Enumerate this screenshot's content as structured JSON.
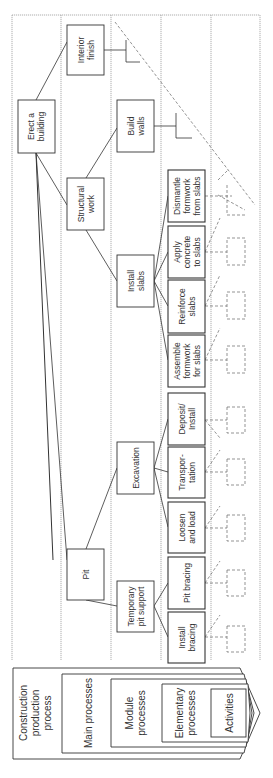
{
  "diagram": {
    "orientation": "rotated-90-ccw",
    "levels": [
      {
        "id": "L1",
        "label": "Construction production process"
      },
      {
        "id": "L2",
        "label": "Main processes"
      },
      {
        "id": "L3",
        "label": "Module processes"
      },
      {
        "id": "L4",
        "label": "Elementary processes"
      },
      {
        "id": "L5",
        "label": "Activities"
      }
    ],
    "nodes": {
      "root": {
        "line1": "Erect a",
        "line2": "building"
      },
      "interior": {
        "line1": "Interior",
        "line2": "finish"
      },
      "structural": {
        "line1": "Structural",
        "line2": "work"
      },
      "pit": {
        "line1": "Pit",
        "line2": ""
      },
      "walls": {
        "line1": "Build",
        "line2": "walls"
      },
      "slabs": {
        "line1": "Install",
        "line2": "slabs"
      },
      "excavation": {
        "line1": "Excavation",
        "line2": ""
      },
      "temp": {
        "line1": "Temporary",
        "line2": "pit support"
      },
      "dismantle": {
        "line1": "Dismantle",
        "line2": "formwork",
        "line3": "from slabs"
      },
      "apply": {
        "line1": "Apply",
        "line2": "concrete",
        "line3": "to slabs"
      },
      "reinforce": {
        "line1": "Reinforce",
        "line2": "slabs",
        "line3": ""
      },
      "assemble": {
        "line1": "Assemble",
        "line2": "formwork",
        "line3": "for slabs"
      },
      "deposit": {
        "line1": "Deposit/",
        "line2": "Install",
        "line3": ""
      },
      "transport": {
        "line1": "Transpor-",
        "line2": "tation",
        "line3": ""
      },
      "loosen": {
        "line1": "Loosen",
        "line2": "and load",
        "line3": ""
      },
      "pitbracing": {
        "line1": "Pit bracing",
        "line2": "",
        "line3": ""
      },
      "installbracing": {
        "line1": "Install",
        "line2": "bracing",
        "line3": ""
      }
    },
    "legend": {
      "l1_line1": "Construction",
      "l1_line2": "production",
      "l1_line3": "process",
      "l2": "Main processes",
      "l3_line1": "Module",
      "l3_line2": "processes",
      "l4_line1": "Elementary",
      "l4_line2": "processes",
      "l5": "Activities"
    },
    "colors": {
      "line": "#333333",
      "grid": "#999999",
      "dashed": "#666666",
      "box_fill": "#ffffff"
    }
  }
}
